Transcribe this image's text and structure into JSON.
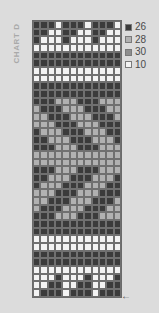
{
  "chart": {
    "title": "CHART D",
    "columns": 12,
    "colors": {
      "26": "#3b3b3b",
      "28": "#b1b1b1",
      "30": "#8e8e8e",
      "10": "#f3f3f3"
    },
    "rows": [
      "DDDWDDDWDDDW",
      "DDWWDDWWDDWW",
      "DWWWDWWWDWWW",
      "WWWWWWWWWWWW",
      "DDDDDDDDDDDD",
      "DDDDDDDDDDDD",
      "WWWWWWWWWWWW",
      "WWWWWWWWWWWW",
      "DDDDDDDDDDDD",
      "DDDDDDDDDDDD",
      "DDDLLLDDDLLL",
      "LDDDLLLDDDLL",
      "LLDDDLLLDDDL",
      "LLLDDDLLLDDD",
      "DLLLDDDLLLDD",
      "DDLLLDDDLLLD",
      "DDDLLLDDDLLL",
      "LLLLLLLLLLLL",
      "LLLLLLLLLLLL",
      "DDDLLLDDDLLL",
      "DDLLLDDDLLLD",
      "DLLLDDDLLLDD",
      "LLLDDDLLLDDD",
      "LLDDDLLLDDDL",
      "LDDDLLLDDDLL",
      "DDDLLLDDDLLL",
      "DDDDDDDDDDDD",
      "DDDDDDDDDDDD",
      "WWWWWWWWWWWW",
      "WWWWWWWWWWWW",
      "DDDDDDDDDDDD",
      "DDDDDDDDDDDD",
      "WWWWWWWWWWWW",
      "WWWDWWWDWWWD",
      "WWDDWWDDWWDD",
      "WDDDWDDDWDDD"
    ],
    "code_map": {
      "D": "26",
      "L": "28",
      "M": "30",
      "W": "10"
    }
  },
  "legend": [
    {
      "code": "26",
      "label": "26",
      "color": "#3b3b3b"
    },
    {
      "code": "28",
      "label": "28",
      "color": "#b1b1b1"
    },
    {
      "code": "30",
      "label": "30",
      "color": "#8e8e8e"
    },
    {
      "code": "10",
      "label": "10",
      "color": "#f3f3f3"
    }
  ],
  "arrow": {
    "glyph": "←",
    "meaning": "start-row-direction"
  }
}
